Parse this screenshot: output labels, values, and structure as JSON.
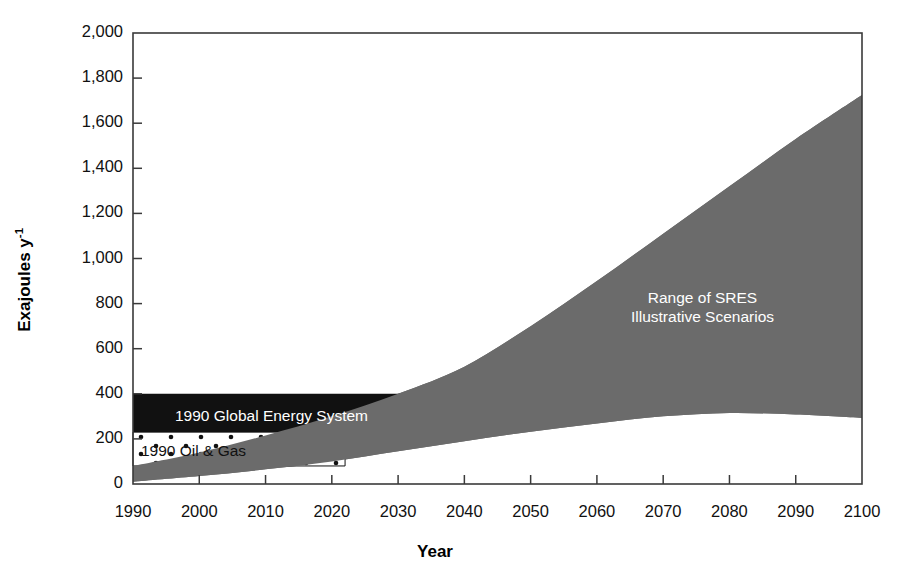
{
  "chart_data": {
    "type": "area",
    "title": "",
    "xlabel": "Year",
    "ylabel": "Exajoules y-1",
    "ylabel_display": "Exajoules y",
    "ylabel_superscript": "-1",
    "xlim": [
      1990,
      2100
    ],
    "ylim": [
      0,
      2000
    ],
    "grid": false,
    "legend_position": "inline-annotations",
    "y_ticks": [
      0,
      200,
      400,
      600,
      800,
      1000,
      1200,
      1400,
      1600,
      1800,
      2000
    ],
    "y_tick_labels": [
      "0",
      "200",
      "400",
      "600",
      "800",
      "1,000",
      "1,200",
      "1,400",
      "1,600",
      "1,800",
      "2,000"
    ],
    "x_ticks": [
      1990,
      2000,
      2010,
      2020,
      2030,
      2040,
      2050,
      2060,
      2070,
      2080,
      2090,
      2100
    ],
    "x_tick_labels": [
      "1990",
      "2000",
      "2010",
      "2020",
      "2030",
      "2040",
      "2050",
      "2060",
      "2070",
      "2080",
      "2090",
      "2100"
    ],
    "x": [
      1990,
      2000,
      2010,
      2020,
      2030,
      2040,
      2050,
      2060,
      2070,
      2080,
      2090,
      2100
    ],
    "series": [
      {
        "name": "Range of SRES Illustrative Scenarios - upper bound",
        "values": [
          80,
          140,
          215,
          300,
          400,
          520,
          700,
          900,
          1110,
          1320,
          1530,
          1725
        ]
      },
      {
        "name": "Range of SRES Illustrative Scenarios - lower bound",
        "values": [
          10,
          35,
          65,
          100,
          145,
          190,
          232,
          268,
          300,
          315,
          308,
          293
        ]
      }
    ],
    "bands": [
      {
        "name": "Range of SRES Illustrative Scenarios",
        "fill": "solid-gray",
        "color": "#6b6b6b",
        "label": "Range of SRES\nIllustrative Scenarios",
        "x_start": 1990,
        "x_end": 2100
      },
      {
        "name": "1990 Global Energy System",
        "fill": "solid-black",
        "color": "#111111",
        "label": "1990 Global Energy System",
        "y_low": 230,
        "y_high": 400,
        "x_start": 1990,
        "x_end": 2045
      },
      {
        "name": "1990 Oil & Gas",
        "fill": "stippled-white",
        "color": "#ffffff",
        "dot_color": "#111111",
        "label": "1990 Oil & Gas",
        "y_low": 80,
        "y_high": 230,
        "x_start": 1990,
        "x_end": 2022
      }
    ],
    "annotations": [
      {
        "id": "sres",
        "text_line1": "Range of SRES",
        "text_line2": "Illustrative Scenarios",
        "color": "#ffffff"
      },
      {
        "id": "global-energy",
        "text": "1990 Global Energy System",
        "color": "#ffffff"
      },
      {
        "id": "oil-gas",
        "text": "1990 Oil & Gas",
        "color": "#111111"
      }
    ],
    "colors": {
      "sres_gray": "#6b6b6b",
      "global_energy_black": "#111111",
      "oil_gas_white": "#ffffff",
      "axis": "#3a3a3a",
      "text": "#111111"
    }
  }
}
